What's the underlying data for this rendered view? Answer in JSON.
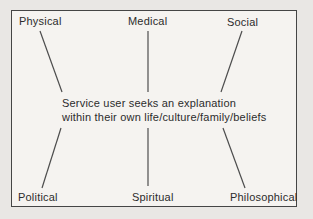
{
  "diagram": {
    "nodes": {
      "top_left": "Physical",
      "top_center": "Medical",
      "top_right": "Social",
      "bottom_left": "Political",
      "bottom_center": "Spiritual",
      "bottom_right": "Philosophical"
    },
    "center_text": [
      "Service user seeks an explanation",
      "within their own life/culture/family/beliefs"
    ],
    "colors": {
      "background": "#e9e7e4",
      "box_background": "#f5f3f0",
      "border": "#454545",
      "line": "#4d4d4d",
      "text": "#2c2c2c"
    }
  }
}
